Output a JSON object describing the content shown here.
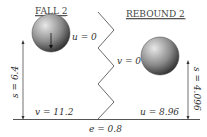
{
  "diagram": {
    "left_panel": {
      "title": "FALL 2",
      "initial_velocity_label": "u = 0",
      "distance_label": "s = 6.4",
      "final_velocity_label": "v = 11.2"
    },
    "right_panel": {
      "title": "REBOUND 2",
      "final_velocity_label": "v = 0",
      "distance_label": "s = 4.096",
      "initial_velocity_label": "u = 8.96"
    },
    "ground": {
      "restitution_label": "e = 0.8"
    },
    "colors": {
      "ball_light": "#d9d9d9",
      "ball_dark": "#2b2b2b",
      "line": "#333333",
      "ground": "#555555"
    }
  }
}
